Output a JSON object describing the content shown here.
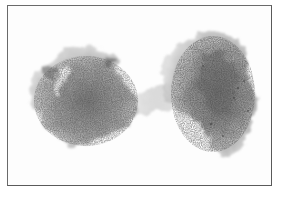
{
  "image": {
    "description": "Grayscale micrograph of two stained cells inside a thin rectangular frame",
    "colors": {
      "background": "#fdfdfd",
      "frame": "#5a5a5a",
      "cell_light": "#b8b8b8",
      "cell_mid": "#9a9a9a",
      "cell_dark": "#6e6e6e"
    },
    "objects": [
      {
        "name": "left-cell",
        "cx": 80,
        "cy": 105,
        "rx": 58,
        "ry": 50
      },
      {
        "name": "right-cell",
        "cx": 200,
        "cy": 95,
        "rx": 55,
        "ry": 62
      }
    ]
  }
}
